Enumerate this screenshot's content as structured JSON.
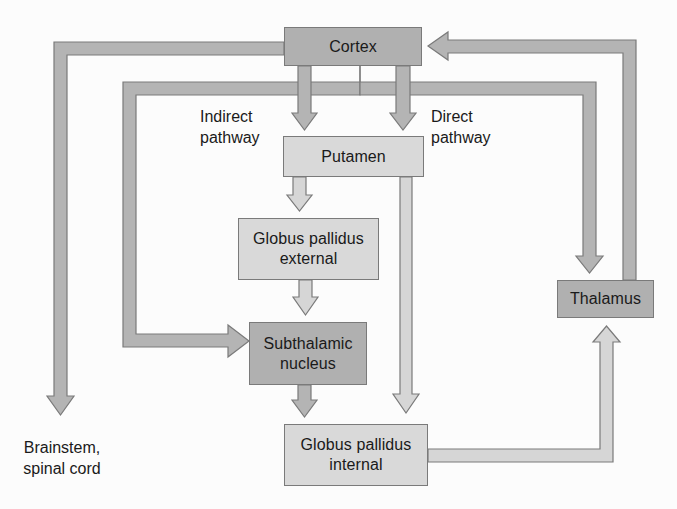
{
  "diagram": {
    "type": "flowchart",
    "colors": {
      "dark_box": "#b0b0b0",
      "light_box": "#d9d9d9",
      "arrow_fill_dark": "#b4b4b4",
      "arrow_fill_light": "#d6d6d6",
      "outline": "#7a7a7a"
    },
    "nodes": {
      "cortex": {
        "label": "Cortex"
      },
      "putamen": {
        "label": "Putamen"
      },
      "gpe": {
        "line1": "Globus pallidus",
        "line2": "external"
      },
      "stn": {
        "line1": "Subthalamic",
        "line2": "nucleus"
      },
      "gpi": {
        "line1": "Globus pallidus",
        "line2": "internal"
      },
      "thalamus": {
        "label": "Thalamus"
      }
    },
    "labels": {
      "indirect": {
        "line1": "Indirect",
        "line2": "pathway"
      },
      "direct": {
        "line1": "Direct",
        "line2": "pathway"
      },
      "brainstem": {
        "line1": "Brainstem,",
        "line2": "spinal cord"
      }
    },
    "edges": [
      {
        "from": "Cortex",
        "to": "Putamen",
        "via": "Indirect pathway"
      },
      {
        "from": "Cortex",
        "to": "Putamen",
        "via": "Direct pathway"
      },
      {
        "from": "Cortex",
        "to": "Brainstem, spinal cord"
      },
      {
        "from": "Cortex",
        "to": "Subthalamic nucleus"
      },
      {
        "from": "Cortex",
        "to": "Thalamus"
      },
      {
        "from": "Thalamus",
        "to": "Cortex"
      },
      {
        "from": "Putamen",
        "to": "Globus pallidus external"
      },
      {
        "from": "Putamen",
        "to": "Globus pallidus internal"
      },
      {
        "from": "Globus pallidus external",
        "to": "Subthalamic nucleus"
      },
      {
        "from": "Subthalamic nucleus",
        "to": "Globus pallidus internal"
      },
      {
        "from": "Globus pallidus internal",
        "to": "Thalamus"
      }
    ]
  }
}
